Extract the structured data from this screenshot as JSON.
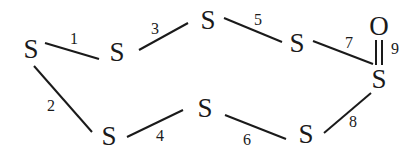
{
  "atoms": [
    {
      "id": "a",
      "label": "S",
      "x": 31,
      "y": 49
    },
    {
      "id": "b",
      "label": "S",
      "x": 117,
      "y": 52
    },
    {
      "id": "c",
      "label": "S",
      "x": 208,
      "y": 20
    },
    {
      "id": "d",
      "label": "S",
      "x": 297,
      "y": 43
    },
    {
      "id": "e",
      "label": "S",
      "x": 379,
      "y": 79
    },
    {
      "id": "o",
      "label": "O",
      "x": 379,
      "y": 26
    },
    {
      "id": "f",
      "label": "S",
      "x": 306,
      "y": 134
    },
    {
      "id": "g",
      "label": "S",
      "x": 205,
      "y": 108
    },
    {
      "id": "h",
      "label": "S",
      "x": 109,
      "y": 136
    }
  ],
  "bonds": [
    {
      "number": "1",
      "from": "a",
      "to": "b",
      "order": 1,
      "x1": 45,
      "y1": 43,
      "x2": 99,
      "y2": 59,
      "lx": 74,
      "ly": 38
    },
    {
      "number": "2",
      "from": "a",
      "to": "h",
      "order": 1,
      "x1": 34,
      "y1": 66,
      "x2": 92,
      "y2": 132,
      "lx": 51,
      "ly": 105
    },
    {
      "number": "3",
      "from": "b",
      "to": "c",
      "order": 1,
      "x1": 139,
      "y1": 50,
      "x2": 188,
      "y2": 23,
      "lx": 155,
      "ly": 28
    },
    {
      "number": "4",
      "from": "h",
      "to": "g",
      "order": 1,
      "x1": 127,
      "y1": 137,
      "x2": 183,
      "y2": 110,
      "lx": 160,
      "ly": 135
    },
    {
      "number": "5",
      "from": "c",
      "to": "d",
      "order": 1,
      "x1": 224,
      "y1": 18,
      "x2": 282,
      "y2": 42,
      "lx": 258,
      "ly": 19
    },
    {
      "number": "6",
      "from": "g",
      "to": "f",
      "order": 1,
      "x1": 225,
      "y1": 115,
      "x2": 286,
      "y2": 139,
      "lx": 247,
      "ly": 139
    },
    {
      "number": "7",
      "from": "d",
      "to": "e",
      "order": 1,
      "x1": 313,
      "y1": 41,
      "x2": 373,
      "y2": 64,
      "lx": 349,
      "ly": 42
    },
    {
      "number": "8",
      "from": "f",
      "to": "e",
      "order": 1,
      "x1": 324,
      "y1": 133,
      "x2": 371,
      "y2": 93,
      "lx": 353,
      "ly": 121
    },
    {
      "number": "9",
      "from": "e",
      "to": "o",
      "order": 2,
      "x1": 379,
      "y1": 40,
      "x2": 379,
      "y2": 65,
      "lx": 395,
      "ly": 48
    }
  ],
  "colors": {
    "ink": "#1a1a1a",
    "background": "#ffffff"
  }
}
